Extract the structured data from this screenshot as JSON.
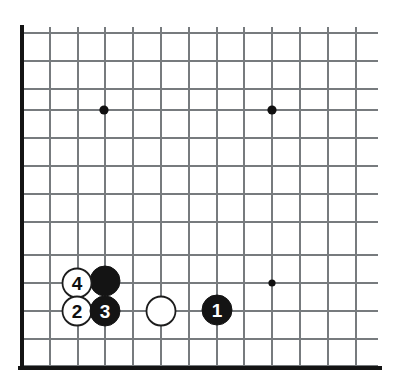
{
  "diagram": {
    "kind": "go-board-corner-diagram",
    "board_region": "bottom-left corner"
  },
  "colors": {
    "background": "#ffffff",
    "grid_line": "#777b7e",
    "board_edge": "#141414",
    "black_stone": "#141414",
    "white_stone": "#ffffff",
    "stone_outline": "#1c1c1c",
    "star_point": "#101010",
    "label_on_black": "#ffffff",
    "label_on_white": "#101010"
  },
  "grid": {
    "vertical_lines_x": [
      22,
      50,
      78,
      105,
      133,
      161,
      189,
      217,
      244,
      272,
      300,
      328,
      356
    ],
    "horizontal_lines_y": [
      33,
      61,
      89,
      110,
      138,
      166,
      194,
      222,
      255,
      283,
      311,
      339,
      366
    ],
    "spacing": 28,
    "line_right_extent": 378,
    "edge_left_x": 22,
    "edge_bottom_y": 368,
    "edge_top_y": 27,
    "edge_right_x": 380
  },
  "star_points": [
    {
      "name": "star-point-upper-left",
      "x": 104,
      "y": 110,
      "r": 4.6
    },
    {
      "name": "star-point-upper-right",
      "x": 272,
      "y": 110,
      "r": 4.6
    },
    {
      "name": "star-point-lower-right",
      "x": 272,
      "y": 283,
      "r": 3.6
    }
  ],
  "stones": [
    {
      "id": "stone-white-unnumbered",
      "color": "white",
      "label": "",
      "x": 161,
      "y": 311,
      "r": 14.5
    },
    {
      "id": "stone-black-unnumbered",
      "color": "black",
      "label": "",
      "x": 105,
      "y": 281,
      "r": 15
    },
    {
      "id": "stone-white-4",
      "color": "white",
      "label": "4",
      "x": 77,
      "y": 283,
      "r": 14.5
    },
    {
      "id": "stone-white-2",
      "color": "white",
      "label": "2",
      "x": 77,
      "y": 311,
      "r": 14.5
    },
    {
      "id": "stone-black-3",
      "color": "black",
      "label": "3",
      "x": 105,
      "y": 311,
      "r": 15
    },
    {
      "id": "stone-black-1",
      "color": "black",
      "label": "1",
      "x": 217,
      "y": 310,
      "r": 15
    }
  ],
  "move_sequence": [
    {
      "move": "1",
      "color": "black"
    },
    {
      "move": "2",
      "color": "white"
    },
    {
      "move": "3",
      "color": "black"
    },
    {
      "move": "4",
      "color": "white"
    }
  ]
}
